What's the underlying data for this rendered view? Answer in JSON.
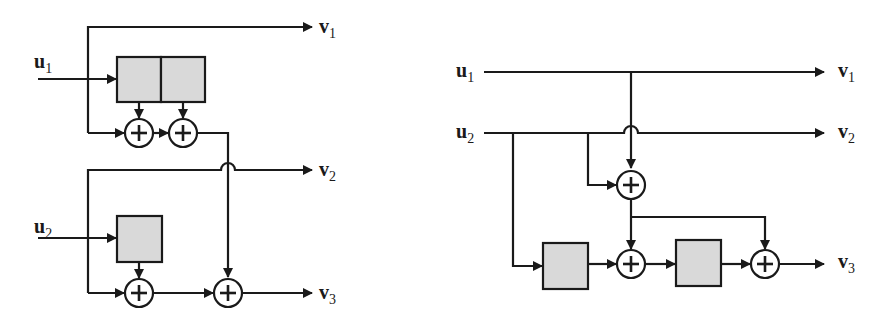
{
  "diagram": {
    "type": "convolutional-encoder-block-diagrams",
    "colors": {
      "line": "#1a1a1a",
      "register_fill": "#d9d9d9",
      "background": "#ffffff"
    },
    "left": {
      "inputs": [
        {
          "name": "u",
          "sub": "1"
        },
        {
          "name": "u",
          "sub": "2"
        }
      ],
      "outputs": [
        {
          "name": "v",
          "sub": "1"
        },
        {
          "name": "v",
          "sub": "2"
        },
        {
          "name": "v",
          "sub": "3"
        }
      ],
      "shift_registers": 3,
      "adders": 4,
      "adder_symbol": "+"
    },
    "right": {
      "inputs": [
        {
          "name": "u",
          "sub": "1"
        },
        {
          "name": "u",
          "sub": "2"
        }
      ],
      "outputs": [
        {
          "name": "v",
          "sub": "1"
        },
        {
          "name": "v",
          "sub": "2"
        },
        {
          "name": "v",
          "sub": "3"
        }
      ],
      "shift_registers": 2,
      "adders": 3,
      "adder_symbol": "+"
    }
  }
}
